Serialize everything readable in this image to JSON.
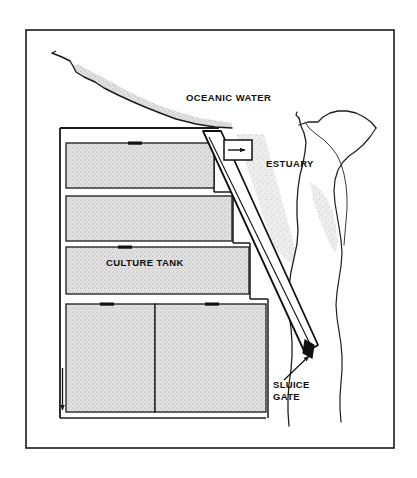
{
  "figure": {
    "canvas": {
      "width": 417,
      "height": 478
    },
    "background_color": "#ffffff",
    "frame": {
      "name": "outer-border",
      "x": 26,
      "y": 30,
      "width": 368,
      "height": 418,
      "stroke_color": "#1a1a1a",
      "stroke_width": 1.6
    }
  },
  "colors": {
    "ink": "#1a1a1a",
    "line": "#2a2a2a",
    "tank_fill": "#dcdcdc",
    "tank_fill_dark": "#d0d0d0",
    "shore_shade": "#c8c8c8",
    "estuary_shade": "#d6d6d6",
    "white": "#ffffff",
    "gate_marker": "#111111"
  },
  "labels": {
    "oceanic_water": "OCEANIC WATER",
    "estuary": "ESTUARY",
    "culture_tank": "CULTURE TANK",
    "sluice_gate_line1": "SLUICE",
    "sluice_gate_line2": "GATE"
  },
  "label_positions": {
    "oceanic_water": {
      "x": 186,
      "y": 101
    },
    "estuary": {
      "x": 266,
      "y": 167
    },
    "culture_tank": {
      "x": 106,
      "y": 265
    },
    "sluice_gate_line1": {
      "x": 273,
      "y": 387
    },
    "sluice_gate_line2": {
      "x": 273,
      "y": 399
    }
  },
  "tanks": [
    {
      "name": "culture-tank-1",
      "x": 66,
      "y": 143,
      "width": 148,
      "height": 45,
      "label": ""
    },
    {
      "name": "culture-tank-2",
      "x": 66,
      "y": 196,
      "width": 165,
      "height": 45,
      "label": ""
    },
    {
      "name": "culture-tank-3",
      "x": 66,
      "y": 247,
      "width": 183,
      "height": 47,
      "label": "CULTURE TANK"
    },
    {
      "name": "culture-tank-4-left",
      "x": 66,
      "y": 304,
      "width": 88,
      "height": 108,
      "label": ""
    },
    {
      "name": "culture-tank-4-right",
      "x": 154,
      "y": 304,
      "width": 110,
      "height": 108,
      "label": ""
    }
  ],
  "tank_inlet_marks": [
    {
      "name": "tank-inlet-mark-1",
      "x": 128,
      "y": 142,
      "width": 13,
      "height": 3
    },
    {
      "name": "tank-inlet-mark-3",
      "x": 118,
      "y": 246,
      "width": 13,
      "height": 3
    },
    {
      "name": "tank-inlet-mark-4a",
      "x": 100,
      "y": 303,
      "width": 13,
      "height": 3
    },
    {
      "name": "tank-inlet-mark-4b",
      "x": 204,
      "y": 303,
      "width": 13,
      "height": 3
    }
  ],
  "facility_wall": {
    "name": "facility-perimeter-wall",
    "points": "60,128 216,128 216,135 60,135",
    "left_wall_x": 60,
    "top_y": 128,
    "bottom_y": 418
  },
  "channel": {
    "name": "supply-channel",
    "description": "Diagonal water supply channel from estuary inlet down to sluice gate",
    "outer_points": "205,131 222,131 317,344 305,352",
    "inner_points": "210,137 216,136 311,344 304,348"
  },
  "inlet_box": {
    "name": "estuary-inlet-box",
    "x": 224,
    "y": 140,
    "width": 28,
    "height": 20,
    "arrow": {
      "name": "inflow-arrow",
      "x1": 229,
      "y1": 150,
      "x2": 247,
      "y2": 150
    }
  },
  "sluice_gate_marker": {
    "name": "sluice-gate-marker",
    "x": 305,
    "y": 341,
    "width": 9,
    "height": 16
  },
  "sluice_leader": {
    "name": "sluice-gate-leader-line",
    "x1": 283,
    "y1": 379,
    "x2": 309,
    "y2": 355
  },
  "drain_arrow": {
    "name": "drainage-arrow",
    "x1": 62,
    "y1": 370,
    "x2": 62,
    "y2": 412
  },
  "coastline": {
    "name": "ocean-coastline",
    "path": "M 52,53 L 62,57 L 70,61 L 73,66 L 76,72 L 84,77 L 95,82 L 104,88 L 118,95 L 131,101 L 145,107 L 160,113 L 176,119 L 196,124 L 215,127 L 232,128",
    "shade_path": "M 73,66 L 76,72 L 84,77 L 95,82 L 104,88 L 118,95 L 131,101 L 145,107 L 160,113 L 176,119 L 196,124 L 215,127 L 232,128 L 232,123 L 200,118 L 178,112 L 158,105 L 140,97 L 122,88 L 104,78 L 88,70 L 78,64 Z"
  },
  "estuary_banks": [
    {
      "name": "estuary-bank-left",
      "path": "M 299,118 L 301,126 L 304,133 L 306,142 L 305,152 L 303,163 L 300,175 L 298,188 L 297,202 L 297,216 L 298,230 L 297,244 L 294,258 L 291,272 L 289,286 L 288,300 L 289,314 L 291,328 L 292,342 L 292,356 L 291,370 L 289,384 L 288,398 L 288,412 L 289,426"
    },
    {
      "name": "estuary-bank-right",
      "path": "M 318,122 L 323,117 L 330,113 L 338,111 L 347,111 L 356,113 L 364,117 L 371,122 L 376,128 L 370,137 L 363,145 L 356,151 L 349,156 L 343,162 L 338,170 L 335,180 L 334,191 L 335,203 L 337,215 L 339,227 L 341,240 L 342,253 L 341,266 L 339,279 L 337,292 L 336,305 L 337,318 L 339,331 L 341,344 L 342,357 L 342,370 L 341,383 L 340,396 L 340,409 L 341,422"
    },
    {
      "name": "estuary-inner-bank",
      "path": "M 305,118 L 309,127 L 316,133 L 324,139 L 331,146 L 337,154 L 341,163 L 344,173 L 346,184 L 347,196 L 347,208 L 346,220"
    }
  ],
  "estuary_shade": {
    "name": "estuary-shallow-shading",
    "path": "M 310,182 L 318,186 L 326,196 L 332,209 L 336,224 L 338,240 L 336,252 L 330,244 L 324,230 L 318,214 L 313,198 Z"
  },
  "shore_wedge": {
    "name": "estuary-shore-wedge",
    "path": "M 236,134 L 262,134 L 294,250 L 290,262 L 276,250 Z"
  },
  "axis_note": {
    "visible_text_only": true
  }
}
